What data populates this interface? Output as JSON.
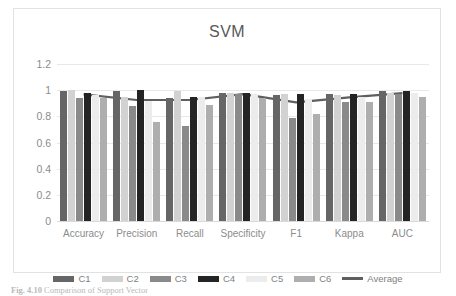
{
  "figure": {
    "caption_label": "Fig. 4.10",
    "caption_text": "Comparison of Support Vector"
  },
  "chart_data": {
    "type": "bar",
    "title": "SVM",
    "xlabel": "",
    "ylabel": "",
    "ylim": [
      0,
      1.2
    ],
    "ytick_labels": [
      "1.2",
      "1",
      "0.8",
      "0.6",
      "0.4",
      "0.2",
      "0"
    ],
    "ytick_values": [
      1.2,
      1.0,
      0.8,
      0.6,
      0.4,
      0.2,
      0
    ],
    "grid": true,
    "legend_position": "bottom",
    "categories": [
      "Accuracy",
      "Precision",
      "Recall",
      "Specificity",
      "F1",
      "Kappa",
      "AUC"
    ],
    "series": [
      {
        "name": "C1",
        "color": "#666666",
        "type": "bar",
        "values": [
          0.99,
          0.99,
          0.94,
          0.98,
          0.96,
          0.97,
          0.99
        ]
      },
      {
        "name": "C2",
        "color": "#d2d2d2",
        "type": "bar",
        "values": [
          1.0,
          0.95,
          0.99,
          0.98,
          0.97,
          0.96,
          0.98
        ]
      },
      {
        "name": "C3",
        "color": "#8a8a8a",
        "type": "bar",
        "values": [
          0.94,
          0.88,
          0.73,
          0.97,
          0.79,
          0.91,
          0.97
        ]
      },
      {
        "name": "C4",
        "color": "#242424",
        "type": "bar",
        "values": [
          0.98,
          1.0,
          0.95,
          0.98,
          0.97,
          0.97,
          0.99
        ]
      },
      {
        "name": "C5",
        "color": "#ececec",
        "type": "bar",
        "values": [
          0.96,
          0.92,
          0.95,
          0.97,
          0.93,
          0.95,
          0.98
        ]
      },
      {
        "name": "C6",
        "color": "#aeaeae",
        "type": "bar",
        "values": [
          0.94,
          0.76,
          0.89,
          0.94,
          0.82,
          0.91,
          0.95
        ]
      },
      {
        "name": "Average",
        "color": "#5f5f5f",
        "type": "line",
        "values": [
          0.968,
          0.925,
          0.925,
          0.97,
          0.907,
          0.945,
          0.977
        ]
      }
    ]
  }
}
